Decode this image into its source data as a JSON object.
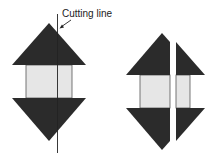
{
  "label": {
    "text": "Cutting line"
  },
  "colors": {
    "dark": "#2b2b2b",
    "light": "#e6e6e6",
    "stroke": "#555555",
    "line": "#222222"
  },
  "figures": [
    {
      "name": "before-cut",
      "description": "Assembled unit with cutting line"
    },
    {
      "name": "after-cut",
      "description": "Unit split into two pieces along the cutting line"
    }
  ]
}
